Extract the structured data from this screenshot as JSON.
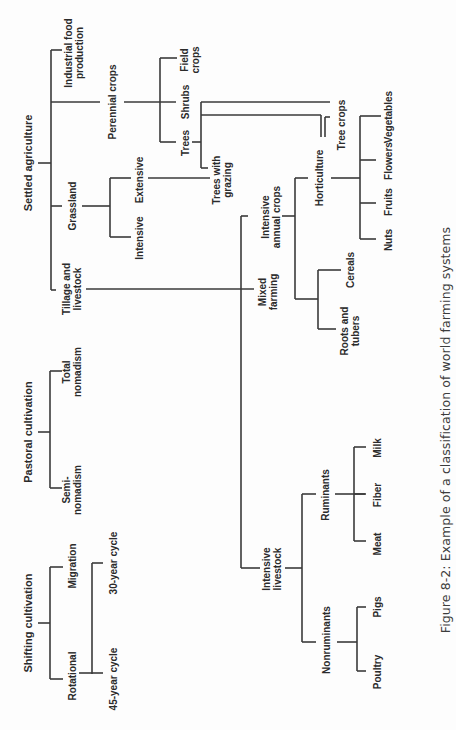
{
  "figure": {
    "caption": "Figure 8-2: Example of a classification of world farming systems",
    "orientation": "rotated 90° counter-clockwise"
  },
  "nodes": {
    "settled_agriculture": "Settled agriculture",
    "industrial_food_production": "Industrial food\nproduction",
    "perennial_crops": "Perennial crops",
    "field_crops": "Field\ncrops",
    "shrubs": "Shrubs",
    "trees": "Trees",
    "tree_crops": "Tree crops",
    "grassland": "Grassland",
    "extensive": "Extensive",
    "intensive_grassland": "Intensive",
    "trees_with_grazing": "Trees with\ngrazing",
    "tillage_and_livestock": "Tillage and\nlivestock",
    "intensive_annual_crops": "Intensive\nannual crops",
    "horticulture": "Horticulture",
    "vegetables": "Vegetables",
    "flowers": "Flowers",
    "fruits": "Fruits",
    "nuts": "Nuts",
    "mixed_farming": "Mixed\nfarming",
    "cereals": "Cereals",
    "roots_and_tubers": "Roots and\ntubers",
    "pastoral_cultivation": "Pastoral cultivation",
    "total_nomadism": "Total\nnomadism",
    "semi_nomadism": "Semi-\nnomadism",
    "intensive_livestock": "Intensive\nlivestock",
    "ruminants": "Ruminants",
    "milk": "Milk",
    "fiber": "Fiber",
    "meat": "Meat",
    "nonruminants": "Nonruminants",
    "pigs": "Pigs",
    "poultry": "Poultry",
    "shifting_cultivation": "Shifting cultivation",
    "migration": "Migration",
    "rotational": "Rotational",
    "thirty_year_cycle": "30-year cycle",
    "fortyfive_year_cycle": "45-year cycle"
  },
  "tree": [
    {
      "label": "Settled agriculture",
      "children": [
        {
          "label": "Industrial food production"
        },
        {
          "label": "Perennial crops",
          "children": [
            {
              "label": "Field crops"
            },
            {
              "label": "Shrubs",
              "links_to": [
                "Tree crops"
              ]
            },
            {
              "label": "Trees",
              "links_to": [
                "Tree crops",
                "Trees with grazing"
              ]
            }
          ]
        },
        {
          "label": "Grassland",
          "children": [
            {
              "label": "Extensive",
              "links_to": [
                "Trees with grazing"
              ]
            },
            {
              "label": "Intensive"
            }
          ]
        },
        {
          "label": "Tillage and livestock",
          "links_to": [
            "Mixed farming"
          ]
        }
      ]
    },
    {
      "label": "Pastoral cultivation",
      "children": [
        {
          "label": "Total nomadism"
        },
        {
          "label": "Semi-nomadism"
        }
      ]
    },
    {
      "label": "Shifting cultivation",
      "children": [
        {
          "label": "Migration"
        },
        {
          "label": "Rotational",
          "children": [
            {
              "label": "30-year cycle"
            },
            {
              "label": "45-year cycle"
            }
          ]
        }
      ]
    },
    {
      "label": "Mixed farming",
      "children": [
        {
          "label": "Intensive annual crops",
          "children": [
            {
              "label": "Horticulture",
              "children": [
                {
                  "label": "Vegetables"
                },
                {
                  "label": "Flowers"
                },
                {
                  "label": "Fruits"
                },
                {
                  "label": "Nuts"
                }
              ]
            },
            {
              "label": "Cereals"
            },
            {
              "label": "Roots and tubers"
            }
          ]
        },
        {
          "label": "Intensive livestock",
          "children": [
            {
              "label": "Ruminants",
              "children": [
                {
                  "label": "Milk"
                },
                {
                  "label": "Fiber"
                },
                {
                  "label": "Meat"
                }
              ]
            },
            {
              "label": "Nonruminants",
              "children": [
                {
                  "label": "Pigs"
                },
                {
                  "label": "Poultry"
                }
              ]
            }
          ]
        }
      ]
    }
  ],
  "colors": {
    "line": "#3a3a3a",
    "text": "#2b2b2b",
    "background": "#fdfdfd"
  }
}
